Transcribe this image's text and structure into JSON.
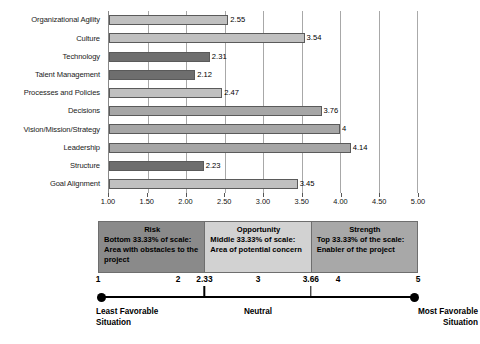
{
  "chart_data": {
    "type": "bar",
    "orientation": "horizontal",
    "title": "",
    "xlabel": "",
    "ylabel": "",
    "xlim": [
      1.0,
      5.0
    ],
    "grid": true,
    "legend_position": "below-chart",
    "categories": [
      "Organizational Agility",
      "Culture",
      "Technology",
      "Talent Management",
      "Processes and Policies",
      "Decisions",
      "Vision/Mission/Strategy",
      "Leadership",
      "Structure",
      "Goal Alignment"
    ],
    "values": [
      2.55,
      3.54,
      2.31,
      2.12,
      2.47,
      3.76,
      4,
      4.14,
      2.23,
      3.45
    ],
    "value_labels": [
      "2.55",
      "3.54",
      "2.31",
      "2.12",
      "2.47",
      "3.76",
      "4",
      "4.14",
      "2.23",
      "3.45"
    ],
    "bar_shades": [
      "light",
      "light",
      "dark",
      "dark",
      "light",
      "medium",
      "medium",
      "medium",
      "dark",
      "light"
    ],
    "xticks": [
      1.0,
      1.5,
      2.0,
      2.5,
      3.0,
      3.5,
      4.0,
      4.5,
      5.0
    ],
    "xtick_labels": [
      "1.00",
      "1.50",
      "2.00",
      "2.50",
      "3.00",
      "3.50",
      "4.00",
      "4.50",
      "5.00"
    ]
  },
  "colors": {
    "bar_light": "#c0c0c0",
    "bar_medium": "#a6a6a6",
    "bar_dark": "#6e6e6e",
    "bar_border": "#5a5a5a",
    "gridline": "#a8a8a8",
    "legend_risk": "#8a8a8a",
    "legend_opportunity": "#d2d2d2",
    "legend_strength": "#a8a8a8",
    "scale_line": "#000000",
    "background": "#ffffff"
  },
  "legend": {
    "segments": [
      {
        "title": "Risk",
        "description": "Bottom 33.33% of scale: Area with obstacles to the project",
        "shade": "legend_risk"
      },
      {
        "title": "Opportunity",
        "description": "Middle 33.33% of scale: Area of potential concern",
        "shade": "legend_opportunity"
      },
      {
        "title": "Strength",
        "description": "Top 33.33% of the scale: Enabler of the project",
        "shade": "legend_strength"
      }
    ]
  },
  "scale": {
    "numbers": [
      "1",
      "2",
      "2.33",
      "3",
      "3.66",
      "4",
      "5"
    ],
    "number_positions": [
      1,
      2,
      2.33,
      3,
      3.66,
      4,
      5
    ],
    "ticks": [
      2.33,
      3.66
    ],
    "min": 1,
    "max": 5,
    "caption_left": "Least Favorable Situation",
    "caption_middle": "Neutral",
    "caption_right": "Most Favorable Situation"
  }
}
